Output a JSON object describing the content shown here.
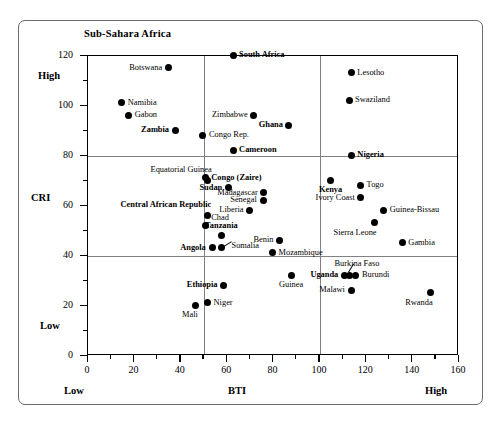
{
  "chart_data": {
    "type": "scatter",
    "title": "Sub-Sahara Africa",
    "xlabel": "BTI",
    "ylabel": "CRI",
    "xlim": [
      0,
      160
    ],
    "ylim": [
      0,
      120
    ],
    "x_major_ticks": [
      0,
      20,
      40,
      60,
      80,
      100,
      120,
      140,
      160
    ],
    "y_major_ticks": [
      0,
      20,
      40,
      60,
      80,
      100,
      120
    ],
    "x_minor_step": 10,
    "y_minor_step": 10,
    "grid": false,
    "legend": "none",
    "x_axis_low_label": "Low",
    "x_axis_high_label": "High",
    "y_axis_low_label": "Low",
    "y_axis_high_label": "High",
    "reference_lines": {
      "vertical": [
        50,
        100
      ],
      "horizontal": [
        40,
        80
      ]
    },
    "points": [
      {
        "name": "Botswana",
        "x": 35,
        "y": 115,
        "bold": false,
        "label_side": "left"
      },
      {
        "name": "South Africa",
        "x": 63,
        "y": 120,
        "bold": true,
        "label_side": "right"
      },
      {
        "name": "Namibia",
        "x": 15,
        "y": 101,
        "bold": false,
        "label_side": "right"
      },
      {
        "name": "Gabon",
        "x": 18,
        "y": 96,
        "bold": false,
        "label_side": "right"
      },
      {
        "name": "Lesotho",
        "x": 114,
        "y": 113,
        "bold": false,
        "label_side": "right"
      },
      {
        "name": "Swaziland",
        "x": 113,
        "y": 102,
        "bold": false,
        "label_side": "right"
      },
      {
        "name": "Zimbabwe",
        "x": 72,
        "y": 96,
        "bold": false,
        "label_side": "left"
      },
      {
        "name": "Zambia",
        "x": 38,
        "y": 90,
        "bold": true,
        "label_side": "left"
      },
      {
        "name": "Ghana",
        "x": 87,
        "y": 92,
        "bold": true,
        "label_side": "left"
      },
      {
        "name": "Congo Rep.",
        "x": 50,
        "y": 88,
        "bold": false,
        "label_side": "right"
      },
      {
        "name": "Cameroon",
        "x": 63,
        "y": 82,
        "bold": true,
        "label_side": "right"
      },
      {
        "name": "Nigeria",
        "x": 114,
        "y": 80,
        "bold": true,
        "label_side": "right"
      },
      {
        "name": "Equatorial Guinea",
        "x": 52,
        "y": 70,
        "bold": false,
        "label_side": "above-left"
      },
      {
        "name": "Congo (Zaire)",
        "x": 51,
        "y": 71,
        "bold": true,
        "label_side": "right"
      },
      {
        "name": "Sudan",
        "x": 61,
        "y": 67,
        "bold": true,
        "label_side": "left"
      },
      {
        "name": "Togo",
        "x": 118,
        "y": 68,
        "bold": false,
        "label_side": "right"
      },
      {
        "name": "Kenya",
        "x": 105,
        "y": 70,
        "bold": true,
        "label_side": "below"
      },
      {
        "name": "Madagascar",
        "x": 76,
        "y": 65,
        "bold": false,
        "label_side": "left"
      },
      {
        "name": "Senegal",
        "x": 76,
        "y": 62,
        "bold": false,
        "label_side": "left"
      },
      {
        "name": "Ivory Coast",
        "x": 118,
        "y": 63,
        "bold": false,
        "label_side": "left"
      },
      {
        "name": "Liberia",
        "x": 70,
        "y": 58,
        "bold": false,
        "label_side": "left"
      },
      {
        "name": "Guinea-Bissau",
        "x": 128,
        "y": 58,
        "bold": false,
        "label_side": "right"
      },
      {
        "name": "Central African Republic",
        "x": 52,
        "y": 56,
        "bold": true,
        "label_side": "above-left"
      },
      {
        "name": "Chad",
        "x": 51,
        "y": 52,
        "bold": false,
        "label_side": "above-right"
      },
      {
        "name": "Sierra Leone",
        "x": 124,
        "y": 53,
        "bold": false,
        "label_side": "below-left"
      },
      {
        "name": "Tanzania",
        "x": 58,
        "y": 48,
        "bold": true,
        "label_side": "above"
      },
      {
        "name": "Benin",
        "x": 83,
        "y": 46,
        "bold": false,
        "label_side": "left"
      },
      {
        "name": "Angola",
        "x": 54,
        "y": 43,
        "bold": true,
        "label_side": "left"
      },
      {
        "name": "Somalia",
        "x": 58,
        "y": 43,
        "bold": false,
        "label_side": "leader"
      },
      {
        "name": "Gambia",
        "x": 136,
        "y": 45,
        "bold": false,
        "label_side": "right"
      },
      {
        "name": "Mozambique",
        "x": 80,
        "y": 41,
        "bold": false,
        "label_side": "right"
      },
      {
        "name": "Burkina Faso",
        "x": 113,
        "y": 32,
        "bold": false,
        "label_side": "leader-up"
      },
      {
        "name": "Burundi",
        "x": 116,
        "y": 32,
        "bold": false,
        "label_side": "right"
      },
      {
        "name": "Uganda",
        "x": 111,
        "y": 32,
        "bold": true,
        "label_side": "left"
      },
      {
        "name": "Guinea",
        "x": 88,
        "y": 32,
        "bold": false,
        "label_side": "below"
      },
      {
        "name": "Ethiopia",
        "x": 59,
        "y": 28,
        "bold": true,
        "label_side": "left"
      },
      {
        "name": "Malawi",
        "x": 114,
        "y": 26,
        "bold": false,
        "label_side": "left"
      },
      {
        "name": "Rwanda",
        "x": 148,
        "y": 25,
        "bold": false,
        "label_side": "below-left"
      },
      {
        "name": "Niger",
        "x": 52,
        "y": 21,
        "bold": false,
        "label_side": "right"
      },
      {
        "name": "Mali",
        "x": 47,
        "y": 20,
        "bold": false,
        "label_side": "below-left"
      }
    ]
  }
}
